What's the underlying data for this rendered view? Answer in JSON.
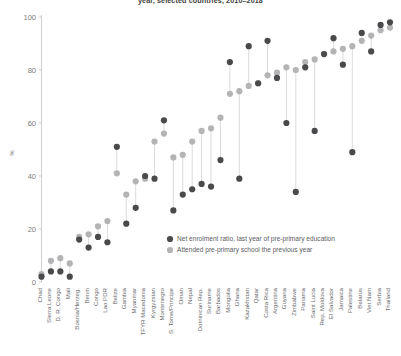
{
  "chart_data": {
    "type": "scatter",
    "title": "year, selected countries, 2010–2018",
    "xlabel": "",
    "ylabel": "%",
    "ylim": [
      0,
      100
    ],
    "yticks": [
      0,
      20,
      40,
      60,
      80,
      100
    ],
    "grid": false,
    "legend_position": "inside-right-lower",
    "colors": {
      "net_enrolment": "#4a4a4c",
      "attended": "#b4b4b6",
      "connector": "#d2d2d2",
      "axis": "#c9c9c9",
      "text": "#6c6d70"
    },
    "categories": [
      "Chad",
      "Sierra Leone",
      "D. R. Congo",
      "Mali",
      "Bosnia/Herzeg.",
      "Benin",
      "Congo",
      "Lao PDR",
      "Belize",
      "Gambia",
      "Myanmar",
      "TFYR Macedonia",
      "Kyrgyzstan",
      "Montenegro",
      "S. Tome/Principe",
      "Oman",
      "Nepal",
      "Dominican Rep.",
      "Suriname",
      "Barbados",
      "Mongolia",
      "Ghana",
      "Kazakhstan",
      "Qatar",
      "Costa Rica",
      "Argentina",
      "Guyana",
      "Zimbabwe",
      "Panama",
      "Saint Lucia",
      "Rep. Moldova",
      "El Salvador",
      "Jamaica",
      "Palestine",
      "Belarus",
      "Viet Nam",
      "Serbia",
      "Thailand"
    ],
    "series": [
      {
        "name": "Net enrolment ratio, last year of pre-primary education",
        "marker": "filled-circle-dark",
        "values": [
          2,
          4,
          4,
          2,
          16,
          13,
          17,
          15,
          51,
          22,
          28,
          40,
          39,
          61,
          27,
          33,
          35,
          37,
          36,
          46,
          83,
          39,
          89,
          75,
          91,
          77,
          60,
          34,
          81,
          57,
          86,
          92,
          82,
          49,
          94,
          87,
          97,
          98
        ]
      },
      {
        "name": "Attended pre-primary school the previous year",
        "marker": "filled-circle-light",
        "values": [
          3,
          8,
          9,
          7,
          17,
          18,
          21,
          23,
          41,
          33,
          38,
          39,
          53,
          56,
          47,
          48,
          53,
          57,
          58,
          62,
          71,
          72,
          74,
          75,
          78,
          79,
          81,
          80,
          83,
          84,
          86,
          87,
          88,
          89,
          91,
          93,
          95,
          96
        ]
      }
    ],
    "legend": [
      {
        "label": "Net enrolment ratio, last year of pre-primary education",
        "color": "#4a4a4c"
      },
      {
        "label": "Attended pre-primary school the previous year",
        "color": "#b4b4b6"
      }
    ]
  }
}
